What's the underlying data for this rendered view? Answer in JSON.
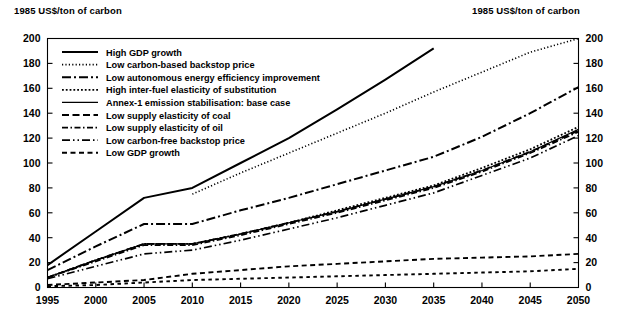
{
  "axis_caption_left": "1985 US$/ton of carbon",
  "axis_caption_right": "1985 US$/ton of carbon",
  "chart_data": {
    "type": "line",
    "title": "",
    "subtitle": "",
    "xlabel": "",
    "ylabel": "1985 US$/ton of carbon",
    "ylabel_right": "1985 US$/ton of carbon",
    "xlim": [
      1995,
      2050
    ],
    "ylim": [
      0,
      200
    ],
    "grid": false,
    "legend_position": "top-left inside plot",
    "x_ticks": [
      1995,
      2000,
      2005,
      2010,
      2015,
      2020,
      2025,
      2030,
      2035,
      2040,
      2045,
      2050
    ],
    "y_ticks": [
      0,
      20,
      40,
      60,
      80,
      100,
      120,
      140,
      160,
      180,
      200
    ],
    "y_ticks_right": [
      0,
      20,
      40,
      60,
      80,
      100,
      120,
      140,
      160,
      180,
      200
    ],
    "x": [
      1995,
      2000,
      2005,
      2010,
      2015,
      2020,
      2025,
      2030,
      2035,
      2040,
      2045,
      2050
    ],
    "series": [
      {
        "name": "High GDP growth",
        "style": "solid",
        "dash": "none",
        "width": 2.0,
        "clipped_at_top": true,
        "reaches_ylim_at_x": 2034,
        "values": [
          18,
          45,
          72,
          80,
          100,
          120,
          143,
          167,
          192,
          null,
          null,
          null
        ]
      },
      {
        "name": "Low carbon-based backstop price",
        "style": "dotted",
        "dash": "1.2,2.2",
        "width": 1.6,
        "clipped_at_top": true,
        "reaches_ylim_at_x": 2048,
        "values": [
          null,
          null,
          null,
          75,
          92,
          108,
          124,
          140,
          157,
          173,
          189,
          200
        ]
      },
      {
        "name": "Low autonomous energy efficiency improvement",
        "style": "dash-dot",
        "dash": "9,3,2,3",
        "width": 2.0,
        "values": [
          14,
          33,
          51,
          51,
          62,
          72,
          83,
          94,
          105,
          121,
          140,
          161
        ]
      },
      {
        "name": "High inter-fuel elasticity of substitution",
        "style": "dotted-fine",
        "dash": "1.8,2.0",
        "width": 1.8,
        "values": [
          8,
          22,
          35,
          35,
          43,
          52,
          62,
          72,
          82,
          96,
          111,
          129
        ]
      },
      {
        "name": "Annex-1 emission stabilisation: base case",
        "style": "solid-thin",
        "dash": "none",
        "width": 1.2,
        "values": [
          8,
          22,
          35,
          35,
          43,
          52,
          61,
          71,
          81,
          94,
          109,
          127
        ]
      },
      {
        "name": "Low supply elasticity of coal",
        "style": "long-dash",
        "dash": "7,3.5",
        "width": 1.8,
        "values": [
          8,
          22,
          35,
          35,
          43,
          52,
          61,
          71,
          81,
          94,
          109,
          126
        ]
      },
      {
        "name": "Low supply elasticity of oil",
        "style": "dash-dot-short",
        "dash": "6,2.5,1.5,2.5",
        "width": 1.7,
        "values": [
          8,
          21,
          34,
          34,
          42,
          51,
          60,
          70,
          80,
          93,
          108,
          125
        ]
      },
      {
        "name": "Low carbon-free backstop price",
        "style": "dash-dot-dot",
        "dash": "8,3,1.5,3,1.5,3",
        "width": 1.7,
        "values": [
          7,
          17,
          27,
          30,
          38,
          47,
          56,
          66,
          76,
          90,
          104,
          122
        ]
      },
      {
        "name": "Low GDP growth",
        "style": "dashed-sparse",
        "dash": "5,3.5",
        "width": 1.9,
        "values": [
          2,
          4,
          6,
          11,
          14,
          17,
          19,
          21,
          23,
          24,
          25,
          27
        ]
      },
      {
        "name": "Low GDP growth (lower bound)",
        "style": "dash-dash",
        "dash": "3.5,3.5",
        "width": 1.9,
        "values": [
          1,
          2,
          4,
          6,
          7,
          8,
          9,
          10,
          11,
          12,
          13,
          15
        ]
      }
    ],
    "legend_entries": [
      {
        "label": "High GDP growth",
        "marker": "solid"
      },
      {
        "label": "Low carbon-based backstop price",
        "marker": "dotted"
      },
      {
        "label": "Low autonomous energy efficiency improvement",
        "marker": "dash-dot"
      },
      {
        "label": "High inter-fuel elasticity of substitution",
        "marker": "dotted-fine"
      },
      {
        "label": "Annex-1 emission stabilisation: base case",
        "marker": "solid-thin"
      },
      {
        "label": "Low supply elasticity of coal",
        "marker": "long-dash"
      },
      {
        "label": "Low supply elasticity of oil",
        "marker": "dash-dot-short"
      },
      {
        "label": "Low carbon-free backstop price",
        "marker": "dash-dot-dot"
      },
      {
        "label": "Low GDP growth",
        "marker": "dash-dash"
      }
    ]
  }
}
